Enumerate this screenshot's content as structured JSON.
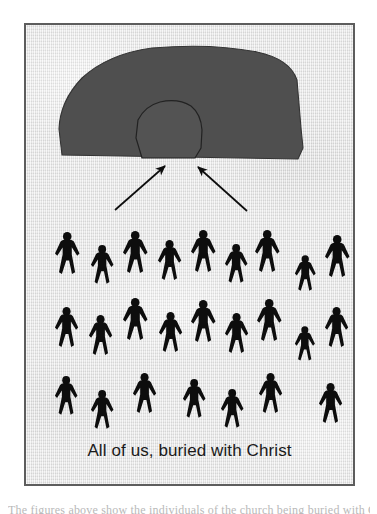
{
  "image": {
    "width": 377,
    "height": 514,
    "background_color": "#ffffff"
  },
  "frame": {
    "border_color": "#5d5d5d",
    "paper_color": "#e9e9e9",
    "x": 24,
    "y": 23,
    "width": 331,
    "height": 463
  },
  "caption": {
    "text": "All of us, buried with Christ",
    "color": "#1a1a1a",
    "font_size_px": 17
  },
  "page_bottom_text": {
    "text": "The figures above show the individuals of the church being buried with Christ",
    "note": "clipped at bottom edge of the image, only faint ascender tips visible"
  },
  "scene": {
    "tomb": {
      "label": "tomb-rock",
      "fill_color": "#4f4f4f",
      "outline_color": "#2e2e2e",
      "mound_path": "M 60 148 L 57 121 Q 58 92 80 69 Q 106 44 150 38 Q 210 33 255 42 Q 288 49 295 70 L 299 118 L 301 138 L 296 149 Z",
      "opening": {
        "label": "tomb-opening",
        "fill_color": "#535353",
        "outline_color": "#262626",
        "path": "M 140 148 L 134 128 L 136 110 Q 143 96 158 92 Q 176 88 189 96 Q 199 104 200 120 L 199 138 L 193 148 Z"
      }
    },
    "arrows": [
      {
        "label": "arrow-left",
        "from": [
          113,
          200
        ],
        "to": [
          162,
          157
        ],
        "color": "#0d0d0d"
      },
      {
        "label": "arrow-right",
        "from": [
          245,
          201
        ],
        "to": [
          196,
          158
        ],
        "color": "#0d0d0d"
      }
    ],
    "crowd": {
      "label": "crowd-of-people",
      "figure_color": "#0d0d0d",
      "description": "Three staggered rows of black pedestrian pictograms representing all believers",
      "total_count": 25,
      "rows": [
        {
          "row": 1,
          "count": 9,
          "figures": [
            {
              "x": 52,
              "y": 232,
              "scale": 1.0
            },
            {
              "x": 112,
              "y": 246,
              "scale": 1.0
            },
            {
              "x": 118,
              "y": 232,
              "scale": 0.0
            },
            {
              "x": 172,
              "y": 232,
              "scale": 1.0
            },
            {
              "x": 126,
              "y": 246,
              "scale": 0.0
            }
          ],
          "positions": [
            {
              "x": 52,
              "y": 231,
              "scale": 1.0
            },
            {
              "x": 88,
              "y": 244,
              "scale": 0.92
            },
            {
              "x": 120,
              "y": 230,
              "scale": 1.0
            },
            {
              "x": 155,
              "y": 239,
              "scale": 0.95
            },
            {
              "x": 188,
              "y": 229,
              "scale": 1.0
            },
            {
              "x": 222,
              "y": 243,
              "scale": 0.92
            },
            {
              "x": 252,
              "y": 229,
              "scale": 1.0
            },
            {
              "x": 292,
              "y": 254,
              "scale": 0.85
            },
            {
              "x": 322,
              "y": 234,
              "scale": 1.0
            }
          ]
        },
        {
          "row": 2,
          "count": 9,
          "positions": [
            {
              "x": 52,
              "y": 306,
              "scale": 0.95
            },
            {
              "x": 86,
              "y": 314,
              "scale": 0.95
            },
            {
              "x": 120,
              "y": 297,
              "scale": 1.0
            },
            {
              "x": 156,
              "y": 311,
              "scale": 0.95
            },
            {
              "x": 188,
              "y": 299,
              "scale": 1.0
            },
            {
              "x": 222,
              "y": 312,
              "scale": 0.95
            },
            {
              "x": 254,
              "y": 298,
              "scale": 1.0
            },
            {
              "x": 292,
              "y": 325,
              "scale": 0.82
            },
            {
              "x": 322,
              "y": 306,
              "scale": 0.95
            }
          ]
        },
        {
          "row": 3,
          "count": 7,
          "positions": [
            {
              "x": 52,
              "y": 375,
              "scale": 0.92
            },
            {
              "x": 88,
              "y": 389,
              "scale": 0.92
            },
            {
              "x": 130,
              "y": 372,
              "scale": 0.95
            },
            {
              "x": 180,
              "y": 378,
              "scale": 0.92
            },
            {
              "x": 218,
              "y": 388,
              "scale": 0.92
            },
            {
              "x": 256,
              "y": 372,
              "scale": 0.95
            },
            {
              "x": 316,
              "y": 382,
              "scale": 0.95
            }
          ]
        }
      ]
    }
  }
}
